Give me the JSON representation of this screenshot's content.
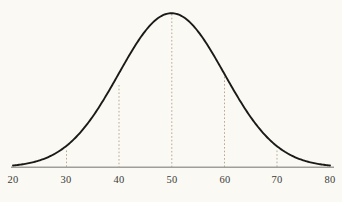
{
  "chart_data": {
    "type": "line",
    "title": "",
    "subtitle": "",
    "xlabel": "",
    "ylabel": "",
    "xlim": [
      20,
      80
    ],
    "ylim": [
      0,
      1
    ],
    "grid": false,
    "legend": null,
    "curve_description": "normal distribution bell curve",
    "distribution": {
      "mean": 50,
      "std_dev": 10,
      "peak_x": 50,
      "peak_y": 1.0
    },
    "xticks": [
      20,
      30,
      40,
      50,
      60,
      70,
      80
    ],
    "xtick_labels": [
      "20",
      "30",
      "40",
      "50",
      "60",
      "70",
      "80"
    ],
    "yticks": [],
    "ytick_labels": [],
    "annotations": [
      {
        "name": "dashed-marker-30",
        "x": 30,
        "y": 0.135
      },
      {
        "name": "dashed-marker-40",
        "x": 40,
        "y": 0.607
      },
      {
        "name": "dashed-marker-50",
        "x": 50,
        "y": 1.0
      },
      {
        "name": "dashed-marker-60",
        "x": 60,
        "y": 0.607
      },
      {
        "name": "dashed-marker-70",
        "x": 70,
        "y": 0.135
      }
    ],
    "x": [
      20,
      22,
      24,
      26,
      28,
      30,
      32,
      34,
      36,
      38,
      40,
      42,
      44,
      46,
      48,
      50,
      52,
      54,
      56,
      58,
      60,
      62,
      64,
      66,
      68,
      70,
      72,
      74,
      76,
      78,
      80
    ],
    "y": [
      0.011,
      0.022,
      0.039,
      0.068,
      0.111,
      0.135,
      0.237,
      0.333,
      0.445,
      0.56,
      0.607,
      0.785,
      0.865,
      0.923,
      0.98,
      1.0,
      0.98,
      0.923,
      0.865,
      0.785,
      0.607,
      0.56,
      0.445,
      0.333,
      0.237,
      0.135,
      0.111,
      0.068,
      0.039,
      0.022,
      0.011
    ],
    "colors": {
      "background": "#faf9f4",
      "curve": "#1a1a18",
      "axis": "#9a9a92",
      "dashed": "#b9a894",
      "tick_text": "#3a3a38"
    }
  },
  "labels": {
    "t20": "20",
    "t30": "30",
    "t40": "40",
    "t50": "50",
    "t60": "60",
    "t70": "70",
    "t80": "80"
  }
}
